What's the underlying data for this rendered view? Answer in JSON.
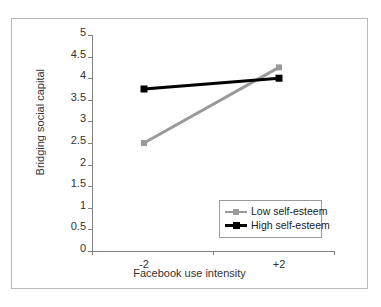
{
  "chart_data": {
    "type": "line",
    "title": "",
    "xlabel": "Facebook use intensity",
    "ylabel": "Bridging social capital",
    "x": [
      "-2",
      "+2"
    ],
    "categories": [
      "-2",
      "+2"
    ],
    "xtick_labels": [
      "-2",
      "+2"
    ],
    "ytick_labels": [
      "0",
      "0.5",
      "1",
      "1.5",
      "2",
      "2.5",
      "3",
      "3.5",
      "4",
      "4.5",
      "5"
    ],
    "ytick_values": [
      0,
      0.5,
      1,
      1.5,
      2,
      2.5,
      3,
      3.5,
      4,
      4.5,
      5
    ],
    "ylim": [
      0,
      5
    ],
    "grid": false,
    "legend_position": "inside-lower-right",
    "series": [
      {
        "name": "Low self-esteem",
        "values": [
          2.5,
          4.25
        ],
        "color": "#9a9a9a",
        "marker": "square"
      },
      {
        "name": "High self-esteem",
        "values": [
          3.75,
          4.0
        ],
        "color": "#000000",
        "marker": "square"
      }
    ]
  },
  "legend": {
    "items": [
      {
        "label": "Low self-esteem"
      },
      {
        "label": "High self-esteem"
      }
    ]
  },
  "axes": {
    "y_title": "Bridging social capital",
    "x_title": "Facebook use intensity"
  },
  "colors": {
    "low_self_esteem": "#9a9a9a",
    "high_self_esteem": "#000000",
    "frame": "#b9b9b9",
    "axis": "#808080",
    "text": "#333333"
  }
}
